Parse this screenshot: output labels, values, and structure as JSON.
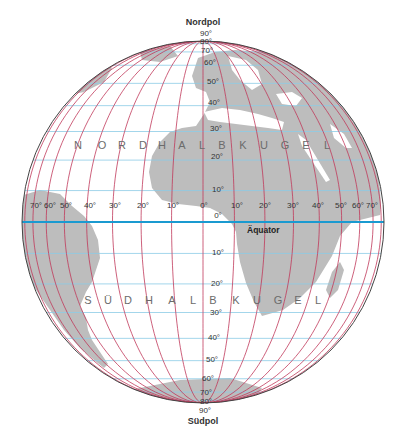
{
  "title_top": "Nordpol",
  "title_bottom": "Südpol",
  "equator_label": "Äquator",
  "hemisphere_north": [
    "N",
    "O",
    "R",
    "D",
    "H",
    "A",
    "L",
    "B",
    "K",
    "U",
    "G",
    "E",
    "L"
  ],
  "hemisphere_south": [
    "S",
    "Ü",
    "D",
    "H",
    "A",
    "L",
    "B",
    "K",
    "U",
    "G",
    "E",
    "L"
  ],
  "colors": {
    "background": "#ffffff",
    "land": "#bdbdbd",
    "meridian": "#c0395a",
    "parallel": "#8ccbe6",
    "equator": "#1a9ad0",
    "outline": "#444444"
  },
  "projection": {
    "type": "orthographic",
    "center_x": 203,
    "center_y": 222,
    "radius": 181
  },
  "latitudes_north": [
    "90°",
    "80°",
    "70°",
    "60°",
    "50°",
    "40°",
    "30°",
    "20°",
    "10°",
    "0°"
  ],
  "latitudes_south": [
    "10°",
    "20°",
    "30°",
    "40°",
    "50°",
    "60°",
    "70°",
    "80°",
    "90°"
  ],
  "longitudes_west": [
    "70°",
    "60°",
    "50°",
    "40°",
    "30°",
    "20°",
    "10°"
  ],
  "longitudes_east": [
    "10°",
    "20°",
    "30°",
    "40°",
    "50°",
    "60°",
    "70°"
  ],
  "longitude_zero": "0°",
  "lat_values": [
    10,
    20,
    30,
    40,
    50,
    60,
    70,
    80
  ],
  "lon_values": [
    -80,
    -70,
    -60,
    -50,
    -40,
    -30,
    -20,
    -10,
    0,
    10,
    20,
    30,
    40,
    50,
    60,
    70,
    80
  ]
}
